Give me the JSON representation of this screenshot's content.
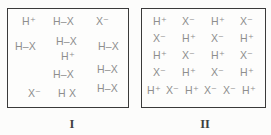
{
  "figure": {
    "boxes": [
      {
        "label": "I",
        "species": [
          {
            "text": "H⁺",
            "kind": "h-plus-ion",
            "x": 14,
            "y": 7
          },
          {
            "text": "H–X",
            "kind": "hx-molecule",
            "x": 45,
            "y": 7
          },
          {
            "text": "X⁻",
            "kind": "x-minus-ion",
            "x": 88,
            "y": 7
          },
          {
            "text": "H–X",
            "kind": "hx-molecule",
            "x": 7,
            "y": 32
          },
          {
            "text": "H–X",
            "kind": "hx-molecule",
            "x": 48,
            "y": 27
          },
          {
            "text": "H–X",
            "kind": "hx-molecule",
            "x": 90,
            "y": 32
          },
          {
            "text": "H⁺",
            "kind": "h-plus-ion",
            "x": 53,
            "y": 42
          },
          {
            "text": "H–X",
            "kind": "hx-molecule",
            "x": 45,
            "y": 60
          },
          {
            "text": "H–X",
            "kind": "hx-molecule",
            "x": 89,
            "y": 55
          },
          {
            "text": "X⁻",
            "kind": "x-minus-ion",
            "x": 20,
            "y": 79
          },
          {
            "text": "H X",
            "kind": "hx-molecule",
            "x": 50,
            "y": 79
          },
          {
            "text": "H–X",
            "kind": "hx-molecule",
            "x": 89,
            "y": 74
          }
        ]
      },
      {
        "label": "II",
        "species": [
          {
            "text": "H⁺",
            "kind": "h-plus-ion",
            "x": 11,
            "y": 7
          },
          {
            "text": "X⁻",
            "kind": "x-minus-ion",
            "x": 40,
            "y": 7
          },
          {
            "text": "H⁺",
            "kind": "h-plus-ion",
            "x": 69,
            "y": 7
          },
          {
            "text": "X⁻",
            "kind": "x-minus-ion",
            "x": 98,
            "y": 7
          },
          {
            "text": "X⁻",
            "kind": "x-minus-ion",
            "x": 11,
            "y": 24
          },
          {
            "text": "H⁺",
            "kind": "h-plus-ion",
            "x": 40,
            "y": 24
          },
          {
            "text": "X⁻",
            "kind": "x-minus-ion",
            "x": 69,
            "y": 24
          },
          {
            "text": "H⁺",
            "kind": "h-plus-ion",
            "x": 98,
            "y": 24
          },
          {
            "text": "H⁺",
            "kind": "h-plus-ion",
            "x": 11,
            "y": 41
          },
          {
            "text": "X⁻",
            "kind": "x-minus-ion",
            "x": 40,
            "y": 41
          },
          {
            "text": "H⁺",
            "kind": "h-plus-ion",
            "x": 69,
            "y": 41
          },
          {
            "text": "X⁻",
            "kind": "x-minus-ion",
            "x": 98,
            "y": 41
          },
          {
            "text": "X⁻",
            "kind": "x-minus-ion",
            "x": 11,
            "y": 58
          },
          {
            "text": "H⁺",
            "kind": "h-plus-ion",
            "x": 40,
            "y": 58
          },
          {
            "text": "X⁻",
            "kind": "x-minus-ion",
            "x": 69,
            "y": 58
          },
          {
            "text": "H⁺",
            "kind": "h-plus-ion",
            "x": 98,
            "y": 58
          },
          {
            "text": "H⁺",
            "kind": "h-plus-ion",
            "x": 5,
            "y": 76
          },
          {
            "text": "X⁻",
            "kind": "x-minus-ion",
            "x": 24,
            "y": 76
          },
          {
            "text": "H⁺",
            "kind": "h-plus-ion",
            "x": 43,
            "y": 76
          },
          {
            "text": "X⁻",
            "kind": "x-minus-ion",
            "x": 62,
            "y": 76
          },
          {
            "text": "X⁻",
            "kind": "x-minus-ion",
            "x": 81,
            "y": 76
          },
          {
            "text": "H⁺",
            "kind": "h-plus-ion",
            "x": 100,
            "y": 76
          }
        ]
      }
    ]
  }
}
